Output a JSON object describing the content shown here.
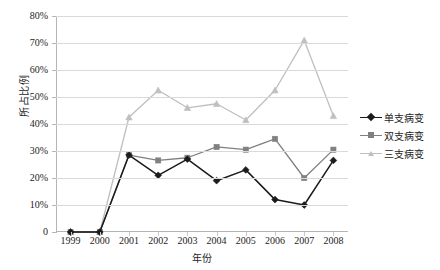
{
  "chart_data": {
    "type": "line",
    "title": "",
    "xlabel": "年份",
    "ylabel": "所占比例",
    "categories": [
      "1999",
      "2000",
      "2001",
      "2002",
      "2003",
      "2004",
      "2005",
      "2006",
      "2007",
      "2008"
    ],
    "x": [
      1999,
      2000,
      2001,
      2002,
      2003,
      2004,
      2005,
      2006,
      2007,
      2008
    ],
    "ylim": [
      0,
      80
    ],
    "ytick_values": [
      0,
      10,
      20,
      30,
      40,
      50,
      60,
      70,
      80
    ],
    "ytick_labels": [
      "0",
      "10%",
      "20%",
      "30%",
      "40%",
      "50%",
      "60%",
      "70%",
      "80%"
    ],
    "grid": true,
    "legend_position": "right",
    "series": [
      {
        "name": "单支病变",
        "color": "#1b1b1b",
        "marker": "diamond",
        "values": [
          0,
          0,
          28.5,
          21.0,
          27.0,
          19.0,
          23.0,
          12.0,
          10.0,
          26.5
        ]
      },
      {
        "name": "双支病变",
        "color": "#808080",
        "marker": "square",
        "values": [
          0,
          0,
          28.5,
          26.5,
          27.5,
          31.5,
          30.5,
          34.5,
          20.0,
          30.5
        ]
      },
      {
        "name": "三支病变",
        "color": "#bfbfbf",
        "marker": "triangle",
        "values": [
          0,
          0,
          42.5,
          52.5,
          46.0,
          47.5,
          41.5,
          52.5,
          71.0,
          43.0
        ]
      }
    ]
  },
  "legend": {
    "items": [
      {
        "label": "单支病变"
      },
      {
        "label": "双支病变"
      },
      {
        "label": "三支病变"
      }
    ]
  },
  "axes": {
    "x_title": "年份",
    "y_title": "所占比例"
  }
}
